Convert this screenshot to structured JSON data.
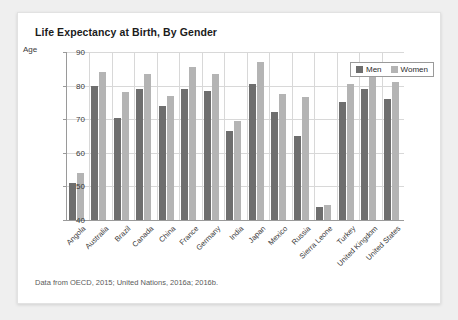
{
  "card": {
    "title": "Life Expectancy at Birth, By Gender",
    "source_note": "Data from OECD, 2015; United Nations, 2016a; 2016b."
  },
  "legend": {
    "position": "top-right",
    "items": [
      {
        "label": "Men",
        "color": "#6e6e6e"
      },
      {
        "label": "Women",
        "color": "#b4b4b4"
      }
    ]
  },
  "chart_data": {
    "type": "bar",
    "title": "Life Expectancy at Birth, By Gender",
    "xlabel": "",
    "ylabel": "Age",
    "ylim": [
      40,
      90
    ],
    "yticks": [
      40,
      50,
      60,
      70,
      80,
      90
    ],
    "grid": true,
    "legend_position": "top-right",
    "categories": [
      "Angola",
      "Australia",
      "Brazil",
      "Canada",
      "China",
      "France",
      "Germany",
      "India",
      "Japan",
      "Mexico",
      "Russia",
      "Sierra Leone",
      "Turkey",
      "United Kingdom",
      "United States"
    ],
    "series": [
      {
        "name": "Men",
        "color": "#6e6e6e",
        "values": [
          51,
          80,
          70.5,
          79,
          74,
          79,
          78.5,
          66.5,
          80.5,
          72,
          65,
          44,
          75,
          79,
          76
        ]
      },
      {
        "name": "Women",
        "color": "#b4b4b4",
        "values": [
          54,
          84,
          78,
          83.5,
          77,
          85.5,
          83.5,
          69.5,
          87,
          77.5,
          76.5,
          44.5,
          80.5,
          83,
          81
        ]
      }
    ]
  }
}
